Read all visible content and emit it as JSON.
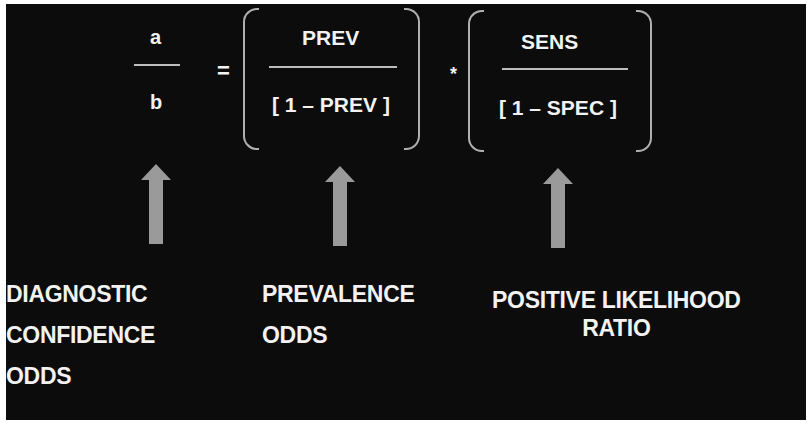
{
  "equation": {
    "lhs": {
      "numerator": "a",
      "denominator": "b"
    },
    "equals": "=",
    "term1": {
      "numerator": "PREV",
      "denominator": "[ 1 – PREV ]"
    },
    "multiply": "*",
    "term2": {
      "numerator": "SENS",
      "denominator": "[ 1 – SPEC ]"
    }
  },
  "labels": {
    "diagnostic": [
      "DIAGNOSTIC",
      "CONFIDENCE",
      "ODDS"
    ],
    "prevalence": [
      "PREVALENCE",
      "ODDS"
    ],
    "likelihood": [
      "POSITIVE LIKELIHOOD",
      "RATIO"
    ]
  },
  "colors": {
    "background": "#0c0c0c",
    "text": "#f2f2f2",
    "arrow": "#9a9a9a",
    "bracket": "#b0b0b0"
  }
}
